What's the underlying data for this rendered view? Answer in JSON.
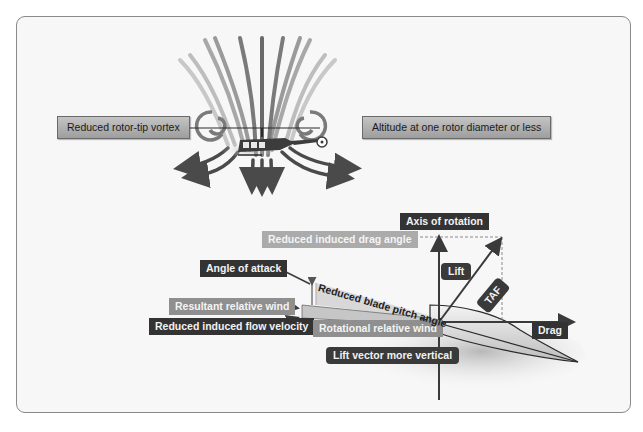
{
  "figure": {
    "colors": {
      "frame_border": "#8a8a8a",
      "frame_bg": "#f7f7f7",
      "label_dark": "#333333",
      "label_mid": "#8f8f8f",
      "label_light": "#ababab",
      "label_grey_box": "#b0b0b0",
      "airflow": "#4a4a4a"
    }
  },
  "top": {
    "left_label": "Reduced rotor-tip vortex",
    "right_label": "Altitude at one rotor diameter or less",
    "illustration": "helicopter-hovering-in-ground-effect"
  },
  "vector_diagram": {
    "axis_of_rotation": "Axis of rotation",
    "reduced_induced_drag_angle": "Reduced induced drag angle",
    "angle_of_attack": "Angle of attack",
    "reduced_blade_pitch_angle": "Reduced blade pitch angle",
    "resultant_relative_wind": "Resultant relative wind",
    "reduced_induced_flow_velocity": "Reduced induced flow velocity",
    "rotational_relative_wind": "Rotational relative wind",
    "lift_vector_more_vertical": "Lift vector more vertical",
    "lift": "Lift",
    "taf": "TAF",
    "drag": "Drag"
  }
}
